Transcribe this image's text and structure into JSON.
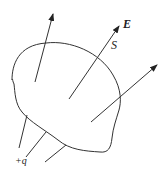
{
  "diagram": {
    "labels": {
      "field": "E",
      "surface": "S",
      "charge": "+q"
    },
    "colors": {
      "stroke": "#333333",
      "background": "#ffffff"
    },
    "elements": {
      "surface": "closed irregular surface S",
      "arrows": [
        "field line arrow 1 (upper-left)",
        "field line arrow 2 (labeled E, crossing surface)",
        "field line arrow 3 (right)"
      ],
      "lines": [
        "field line from charge 1",
        "field line from charge 2",
        "field line from charge 3"
      ]
    }
  }
}
